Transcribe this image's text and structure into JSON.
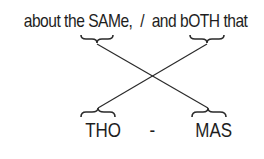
{
  "diagram": {
    "top_text": {
      "before": "about the ",
      "word_a": "SAMe",
      "middle": ",  /  and ",
      "word_b": "bOTH",
      "after": " that"
    },
    "bottom": {
      "left": "THO",
      "separator": "-",
      "right": "MAS"
    },
    "connections": [
      {
        "from": "SAMe",
        "to": "MAS"
      },
      {
        "from": "bOTH",
        "to": "THO"
      }
    ],
    "colors": {
      "text": "#1e1e1e",
      "line": "#2a2a2a",
      "background": "#ffffff"
    }
  }
}
